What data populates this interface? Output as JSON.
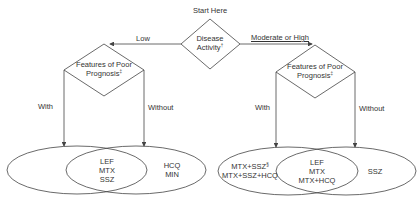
{
  "start": {
    "label": "Start Here"
  },
  "decision_main": {
    "line1": "Disease",
    "line2": "Activity",
    "mark": "†"
  },
  "branch_left": {
    "label": "Low"
  },
  "branch_right": {
    "label": "Moderate or High"
  },
  "decision_left": {
    "line1": "Features of Poor",
    "line2": "Prognosis",
    "mark": "‡"
  },
  "decision_right": {
    "line1": "Features of Poor",
    "line2": "Prognosis",
    "mark": "‡"
  },
  "left_edges": {
    "with": "With",
    "without": "Without"
  },
  "right_edges": {
    "with": "With",
    "without": "Without"
  },
  "venn_left": {
    "overlap": [
      "LEF",
      "MTX",
      "SSZ"
    ],
    "right_only": [
      "HCQ",
      "MIN"
    ],
    "left_only": []
  },
  "venn_right": {
    "left_only": [
      "MTX+SSZ",
      "MTX+SSZ+HCQ"
    ],
    "left_only_mark": "§",
    "overlap": [
      "LEF",
      "MTX",
      "MTX+HCQ"
    ],
    "right_only": [
      "SSZ"
    ]
  },
  "colors": {
    "stroke": "#444444",
    "text": "#333333",
    "background": "#ffffff"
  }
}
